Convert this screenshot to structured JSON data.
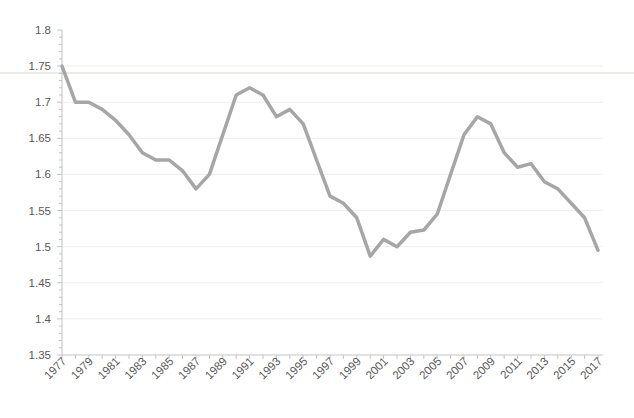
{
  "page": {
    "background": "#ffffff"
  },
  "chart_data": {
    "type": "line",
    "title": "",
    "xlabel": "",
    "ylabel": "",
    "x": [
      1977,
      1978,
      1979,
      1980,
      1981,
      1982,
      1983,
      1984,
      1985,
      1986,
      1987,
      1988,
      1989,
      1990,
      1991,
      1992,
      1993,
      1994,
      1995,
      1996,
      1997,
      1998,
      1999,
      2000,
      2001,
      2002,
      2003,
      2004,
      2005,
      2006,
      2007,
      2008,
      2009,
      2010,
      2011,
      2012,
      2013,
      2014,
      2015,
      2016,
      2017
    ],
    "values": [
      1.75,
      1.7,
      1.7,
      1.69,
      1.675,
      1.655,
      1.63,
      1.62,
      1.62,
      1.605,
      1.58,
      1.6,
      1.655,
      1.71,
      1.72,
      1.71,
      1.68,
      1.69,
      1.67,
      1.62,
      1.57,
      1.56,
      1.54,
      1.487,
      1.51,
      1.5,
      1.52,
      1.523,
      1.545,
      1.6,
      1.655,
      1.68,
      1.67,
      1.63,
      1.61,
      1.615,
      1.59,
      1.58,
      1.56,
      1.54,
      1.495
    ],
    "ylim": [
      1.35,
      1.8
    ],
    "ytick_step": 0.05,
    "ytick_minor_step": 0.01,
    "ytick_labels": [
      "1.8",
      "1.75",
      "1.7",
      "1.65",
      "1.6",
      "1.55",
      "1.5",
      "1.45",
      "1.4",
      "1.35"
    ],
    "xtick_labels": [
      "1977",
      "1979",
      "1981",
      "1983",
      "1985",
      "1987",
      "1989",
      "1991",
      "1993",
      "1995",
      "1997",
      "1999",
      "2001",
      "2003",
      "2005",
      "2007",
      "2009",
      "2011",
      "2013",
      "2015",
      "2017"
    ],
    "xtick_every": 2,
    "x_label_rotation_deg": 45,
    "grid": true,
    "legend_position": "none",
    "colors": {
      "line": "#a6a6a6",
      "axis": "#c3c3c3",
      "grid": "#eeeeec",
      "tick_label": "#595959",
      "divider": "#e3e3df"
    }
  }
}
